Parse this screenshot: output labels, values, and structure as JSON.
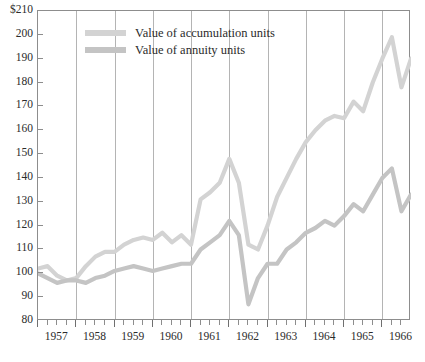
{
  "chart_data": {
    "type": "line",
    "title": "",
    "xlabel": "",
    "ylabel": "",
    "ylim": [
      80,
      210
    ],
    "xlim": [
      1957,
      1966.75
    ],
    "grid": "vertical-year-gridlines",
    "legend_position": "inside-top-left",
    "y_ticks": [
      "80",
      "90",
      "100",
      "110",
      "120",
      "130",
      "140",
      "150",
      "160",
      "170",
      "180",
      "190",
      "200",
      "$210"
    ],
    "y_tick_values": [
      80,
      90,
      100,
      110,
      120,
      130,
      140,
      150,
      160,
      170,
      180,
      190,
      200,
      210
    ],
    "x_tick_labels": [
      "1957",
      "1958",
      "1959",
      "1960",
      "1961",
      "1962",
      "1963",
      "1964",
      "1965",
      "1966"
    ],
    "x_tick_values": [
      1957,
      1958,
      1959,
      1960,
      1961,
      1962,
      1963,
      1964,
      1965,
      1966
    ],
    "minor_ticks_per_year": 4,
    "x": [
      1957.0,
      1957.25,
      1957.5,
      1957.75,
      1958.0,
      1958.25,
      1958.5,
      1958.75,
      1959.0,
      1959.25,
      1959.5,
      1959.75,
      1960.0,
      1960.25,
      1960.5,
      1960.75,
      1961.0,
      1961.25,
      1961.5,
      1961.75,
      1962.0,
      1962.25,
      1962.5,
      1962.75,
      1963.0,
      1963.25,
      1963.5,
      1963.75,
      1964.0,
      1964.25,
      1964.5,
      1964.75,
      1965.0,
      1965.25,
      1965.5,
      1965.75,
      1966.0,
      1966.25,
      1966.5,
      1966.75
    ],
    "series": [
      {
        "name": "Value of accumulation units",
        "color": "#d3d3d3",
        "values": [
          102,
          103,
          99,
          97,
          98,
          103,
          107,
          109,
          109,
          112,
          114,
          115,
          114,
          117,
          113,
          116,
          112,
          131,
          134,
          138,
          148,
          138,
          112,
          110,
          120,
          132,
          140,
          148,
          155,
          160,
          164,
          166,
          165,
          172,
          168,
          180,
          190,
          199,
          178,
          190
        ]
      },
      {
        "name": "Value of annuity units",
        "color": "#c4c4c4",
        "values": [
          100,
          98,
          96,
          97,
          97,
          96,
          98,
          99,
          101,
          102,
          103,
          102,
          101,
          102,
          103,
          104,
          104,
          110,
          113,
          116,
          122,
          116,
          87,
          98,
          104,
          104,
          110,
          113,
          117,
          119,
          122,
          120,
          124,
          129,
          126,
          133,
          140,
          144,
          126,
          133
        ]
      }
    ]
  },
  "legend": {
    "items": [
      {
        "label": "Value of accumulation units",
        "color": "#d3d3d3"
      },
      {
        "label": "Value of annuity units",
        "color": "#c4c4c4"
      }
    ]
  },
  "caption": {
    "sliver_text": ""
  }
}
